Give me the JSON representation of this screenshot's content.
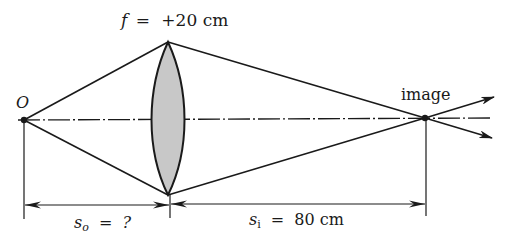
{
  "diagram": {
    "type": "thin converging lens ray diagram",
    "focal_length_label": {
      "symbol": "f",
      "equals": "=",
      "value": "+20 cm"
    },
    "object_label": "O",
    "image_label": "image",
    "object_distance_label": {
      "symbol": "s",
      "subscript": "o",
      "equals": "=",
      "value": "?"
    },
    "image_distance_label": {
      "symbol": "s",
      "subscript": "i",
      "equals": "=",
      "value": "80 cm"
    },
    "colors": {
      "line": "#1a1a1a",
      "lens_fill": "#c8c8c8",
      "background": "#ffffff"
    }
  }
}
